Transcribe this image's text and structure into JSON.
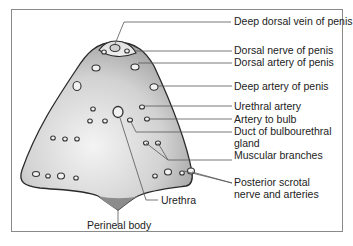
{
  "diagram": {
    "type": "anatomical cross-section",
    "labels": {
      "deep_dorsal_vein": "Deep dorsal vein of penis",
      "dorsal_nerve": "Dorsal nerve of penis",
      "dorsal_artery": "Dorsal artery of penis",
      "deep_artery": "Deep artery of penis",
      "urethral_artery": "Urethral artery",
      "artery_to_bulb": "Artery to bulb",
      "duct_line1": "Duct of bulbourethral",
      "duct_line2": "gland",
      "muscular_branches": "Muscular branches",
      "posterior_line1": "Posterior scrotal",
      "posterior_line2": "nerve and arteries",
      "urethra": "Urethra",
      "perineal_body": "Perineal body"
    },
    "colors": {
      "frame": "#8a8a8a",
      "outline": "#2a2a2a",
      "fill_dark": "#9a9a9a",
      "fill_light": "#f2f2f2",
      "leader": "#555555"
    }
  }
}
